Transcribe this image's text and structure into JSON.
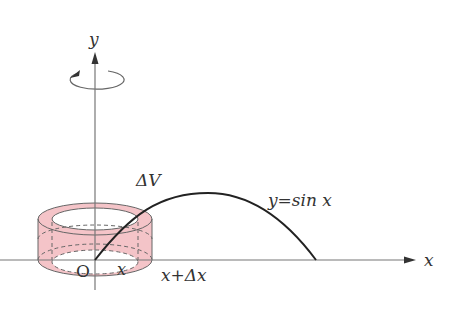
{
  "figure": {
    "labels": {
      "y_axis": "y",
      "x_axis": "x",
      "origin": "O",
      "delta_v": "ΔV",
      "curve": "y=sin x",
      "inner_radius": "x",
      "outer_radius": "x+Δx"
    },
    "colors": {
      "shell_fill": "#f4c4c8",
      "shell_stroke": "#555555",
      "axis": "#777777",
      "curve": "#222222",
      "text": "#333333"
    },
    "annotations": {
      "rotation_arrow": "rotation about y-axis"
    }
  }
}
